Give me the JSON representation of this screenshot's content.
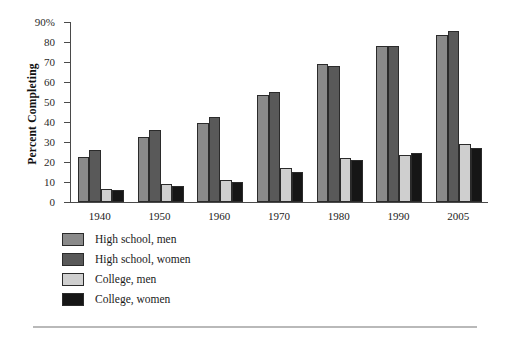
{
  "chart_data": {
    "type": "bar",
    "title": "",
    "xlabel": "",
    "ylabel": "Percent Completing",
    "categories": [
      "1940",
      "1950",
      "1960",
      "1970",
      "1980",
      "1990",
      "2005"
    ],
    "ylim": [
      0,
      90
    ],
    "ytick_values": [
      0,
      10,
      20,
      30,
      40,
      50,
      60,
      70,
      80,
      90
    ],
    "ytick_labels": [
      "0",
      "10",
      "20",
      "30",
      "40",
      "50",
      "60",
      "70",
      "80",
      "90%"
    ],
    "grid": false,
    "legend_position": "below-left",
    "series": [
      {
        "name": "High school, men",
        "color": "#8a8a8a",
        "values": [
          22.5,
          32.5,
          39.5,
          53.5,
          69.0,
          78.0,
          83.5
        ]
      },
      {
        "name": "High school, women",
        "color": "#595959",
        "values": [
          26.0,
          36.0,
          42.5,
          55.0,
          68.0,
          78.0,
          85.5
        ]
      },
      {
        "name": "College, men",
        "color": "#cfcfcf",
        "values": [
          6.5,
          9.0,
          11.0,
          17.0,
          22.0,
          23.5,
          29.0
        ]
      },
      {
        "name": "College, women",
        "color": "#161616",
        "values": [
          6.0,
          8.0,
          10.0,
          15.0,
          21.0,
          24.5,
          27.0
        ]
      }
    ]
  }
}
